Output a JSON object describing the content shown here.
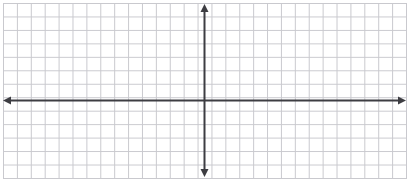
{
  "figure": {
    "width": 409,
    "height": 188,
    "background_color": "#ffffff"
  },
  "chart_data": {
    "type": "scatter",
    "title": "",
    "subtitle": "",
    "xlabel": "",
    "ylabel": "",
    "series": [
      {
        "name": "plotted-points",
        "x": [],
        "y": []
      }
    ],
    "x": [],
    "categories": [],
    "values": [],
    "annotations": [],
    "tick_labels": {
      "x": [],
      "y": []
    },
    "xlim": [
      -14.6,
      14.6
    ],
    "ylim": [
      -5.6,
      7.0
    ],
    "grid": true,
    "grid_spacing_units": 1,
    "legend": false,
    "legend_position": "none",
    "axis_arrows": {
      "x_left": true,
      "x_right": true,
      "y_top": true,
      "y_bottom": true
    }
  },
  "grid": {
    "cell_size_px": 13.7,
    "line_color": "#c9c9ce",
    "line_width_px": 1,
    "left_px": 3,
    "top_px": 3,
    "right_px": 406,
    "bottom_px": 178,
    "columns": 29,
    "rows": 13
  },
  "axes": {
    "color": "#3d3d42",
    "line_width_px": 2,
    "origin_x_px": 204,
    "origin_y_px": 100,
    "x_axis": {
      "name": "horizontal-axis",
      "start_px": 4,
      "end_px": 405,
      "y_px": 100
    },
    "y_axis": {
      "name": "vertical-axis",
      "start_px": 5,
      "end_px": 176,
      "x_px": 204
    },
    "arrow_size_px": 7
  }
}
